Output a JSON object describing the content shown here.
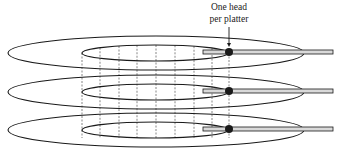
{
  "annotation": {
    "line1": "One head",
    "line2": "per platter"
  },
  "platters": [
    {
      "label": "platter-1",
      "cy": 53
    },
    {
      "label": "platter-2",
      "cy": 92
    },
    {
      "label": "platter-3",
      "cy": 130
    }
  ],
  "geometry": {
    "cx": 156,
    "outer_rx": 148,
    "outer_ry": 17,
    "inner_cx": 155,
    "inner_rx": 73,
    "inner_ry": 8,
    "arm_x1": 203,
    "arm_x2": 333,
    "arm_h": 4,
    "head_x": 229,
    "head_r": 4,
    "cylinder_lines_x": [
      82,
      100,
      119,
      137,
      156,
      175,
      194,
      212,
      229
    ]
  },
  "colors": {
    "stroke": "#1a1a1a",
    "arm_fill": "#d9d9d9",
    "dashed": "#555555"
  }
}
